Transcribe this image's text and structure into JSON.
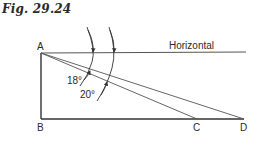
{
  "figure": {
    "title": "Fig. 29.24"
  },
  "diagram": {
    "points": {
      "A": {
        "label": "A"
      },
      "B": {
        "label": "B"
      },
      "C": {
        "label": "C"
      },
      "D": {
        "label": "D"
      }
    },
    "horizontal_label": "Horizontal",
    "angles": [
      {
        "label": "18°",
        "between": "Horizontal and AC"
      },
      {
        "label": "20°",
        "between": "Horizontal and AD"
      }
    ],
    "line_color": "#333333"
  }
}
